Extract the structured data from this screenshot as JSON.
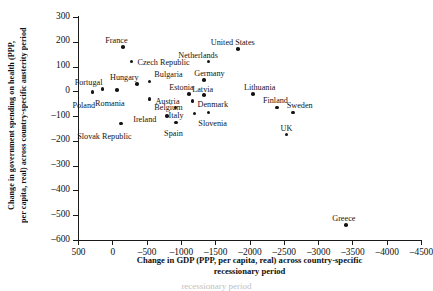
{
  "chart_data": {
    "type": "scatter",
    "title": "",
    "xlabel": "Change in GDP (PPP, per capita, real) across country-specific recessionary period",
    "ylabel": "Change in government spending on health (PPP, per capita, real) across country-specific austerity period",
    "xlim": [
      500,
      -4500
    ],
    "ylim": [
      -600,
      300
    ],
    "xticks": [
      "500",
      "0",
      "-500",
      "-1000",
      "-1500",
      "-2000",
      "-2500",
      "-3000",
      "-3500",
      "-4000",
      "-4500"
    ],
    "yticks": [
      "300",
      "200",
      "100",
      "0",
      "-100",
      "-200",
      "-300",
      "-400",
      "-500",
      "-600"
    ],
    "grid": false,
    "legend": "none",
    "points": [
      {
        "label": "Poland",
        "x": 290,
        "y": -3,
        "lx": -20,
        "ly": 9
      },
      {
        "label": "Portugal",
        "x": 140,
        "y": 10,
        "lx": -28,
        "ly": -11
      },
      {
        "label": "Romania",
        "x": -70,
        "y": 5,
        "lx": -22,
        "ly": 9
      },
      {
        "label": "Hungary",
        "x": -360,
        "y": 30,
        "lx": -27,
        "ly": -11
      },
      {
        "label": "France",
        "x": -160,
        "y": 180,
        "lx": -18,
        "ly": -11
      },
      {
        "label": "Czech Republic",
        "x": -280,
        "y": 120,
        "lx": 6,
        "ly": -4
      },
      {
        "label": "Bulgaria",
        "x": -540,
        "y": 40,
        "lx": 5,
        "ly": -11
      },
      {
        "label": "Belgium",
        "x": -540,
        "y": -30,
        "lx": 5,
        "ly": 4
      },
      {
        "label": "Slovak Republic",
        "x": -130,
        "y": -130,
        "lx": -44,
        "ly": 8
      },
      {
        "label": "Estonia",
        "x": -1120,
        "y": -10,
        "lx": -20,
        "ly": -11
      },
      {
        "label": "Austria",
        "x": -920,
        "y": -65,
        "lx": -20,
        "ly": -10
      },
      {
        "label": "Ireland",
        "x": -800,
        "y": -100,
        "lx": -34,
        "ly": -1
      },
      {
        "label": "Spain",
        "x": -930,
        "y": -125,
        "lx": -12,
        "ly": 7
      },
      {
        "label": "Denmark",
        "x": -1170,
        "y": -40,
        "lx": 5,
        "ly": -1
      },
      {
        "label": "Italy",
        "x": -1200,
        "y": -90,
        "lx": -26,
        "ly": -3
      },
      {
        "label": "Slovenia",
        "x": -1400,
        "y": -85,
        "lx": -10,
        "ly": 7
      },
      {
        "label": "Germany",
        "x": -1340,
        "y": 45,
        "lx": -10,
        "ly": -11
      },
      {
        "label": "Latvia",
        "x": -1340,
        "y": -15,
        "lx": -12,
        "ly": -10
      },
      {
        "label": "Netherlands",
        "x": -1400,
        "y": 120,
        "lx": -30,
        "ly": -11
      },
      {
        "label": "United States",
        "x": -1830,
        "y": 170,
        "lx": -27,
        "ly": -11
      },
      {
        "label": "Lithuania",
        "x": -2050,
        "y": -10,
        "lx": -9,
        "ly": -11
      },
      {
        "label": "Finland",
        "x": -2400,
        "y": -65,
        "lx": -14,
        "ly": -11
      },
      {
        "label": "Sweden",
        "x": -2630,
        "y": -85,
        "lx": -6,
        "ly": -11
      },
      {
        "label": "UK",
        "x": -2540,
        "y": -175,
        "lx": -6,
        "ly": -11
      },
      {
        "label": "Greece",
        "x": -3410,
        "y": -540,
        "lx": -14,
        "ly": -11
      }
    ]
  },
  "caption": {
    "text": "recessionary period"
  }
}
